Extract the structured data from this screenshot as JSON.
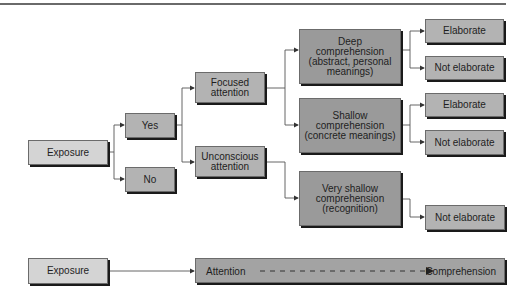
{
  "diagram": {
    "tree": {
      "exposure": "Exposure",
      "yes": "Yes",
      "no": "No",
      "focused_attention": "Focused\nattention",
      "unconscious_attention": "Unconscious\nattention",
      "deep_comprehension": "Deep\ncomprehension\n(abstract, personal\nmeanings)",
      "shallow_comprehension": "Shallow\ncomprehension\n(concrete meanings)",
      "very_shallow_comprehension": "Very shallow\ncomprehension\n(recognition)",
      "deep_outcomes": [
        "Elaborate",
        "Not elaborate"
      ],
      "shallow_outcomes": [
        "Elaborate",
        "Not elaborate"
      ],
      "very_shallow_outcomes": [
        "Not elaborate"
      ]
    },
    "summary": {
      "exposure": "Exposure",
      "attention": "Attention",
      "comprehension": "Comprehension"
    },
    "colors": {
      "light_box": "#d4d4d4",
      "mid_box": "#b3b3b3",
      "dark_box": "#9a9a9a",
      "line": "#555555"
    }
  }
}
